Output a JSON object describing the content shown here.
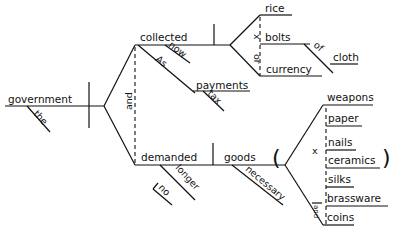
{
  "diagram": {
    "type": "sentence-diagram",
    "subject": {
      "word": "government",
      "modifier": "the"
    },
    "conjunction": "and",
    "predicates": [
      {
        "verb": "collected",
        "modifiers": [
          "now",
          "As"
        ],
        "object_branch": {
          "word": "payments",
          "modifier": "tax"
        },
        "objects": {
          "conjunction_marks": [
            "x",
            "or"
          ],
          "items": [
            "rice",
            "bolts",
            "currency"
          ],
          "bolts_modifier": {
            "preposition": "of",
            "object": "cloth"
          }
        }
      },
      {
        "verb": "demanded",
        "modifiers": [
          "longer",
          "no"
        ],
        "object": {
          "word": "goods",
          "modifier": "necessary",
          "items": [
            "weapons",
            "paper",
            "nails",
            "ceramics",
            "silks",
            "brassware",
            "coins"
          ],
          "conjunction_marks": [
            "x",
            "and"
          ],
          "paren_open": "(",
          "paren_close": ")"
        }
      }
    ]
  }
}
